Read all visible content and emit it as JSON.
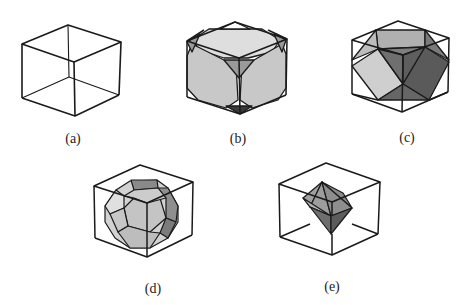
{
  "figure": {
    "panels": [
      {
        "id": "a",
        "label": "(a)",
        "description": "cube wireframe"
      },
      {
        "id": "b",
        "label": "(b)",
        "description": "truncated cube inside cube"
      },
      {
        "id": "c",
        "label": "(c)",
        "description": "cuboctahedron inside cube"
      },
      {
        "id": "d",
        "label": "(d)",
        "description": "truncated octahedron inside cube"
      },
      {
        "id": "e",
        "label": "(e)",
        "description": "octahedron inside cube"
      }
    ]
  },
  "colors": {
    "edge": "#1a1a1a",
    "face_light": "#d4d4d4",
    "face_mid": "#a8a8a8",
    "face_dark": "#6e6e6e",
    "face_darkest": "#3a3a3a",
    "background": "#ffffff"
  }
}
